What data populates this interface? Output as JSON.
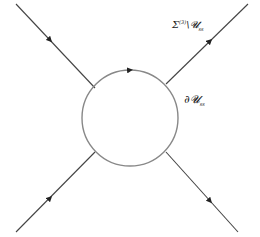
{
  "diagram": {
    "type": "feynman-like loop diagram",
    "labels": {
      "outer_sigma": "Σ",
      "outer_sup": "(3)",
      "outer_rest": "\\𝓤",
      "outer_sub": "ss",
      "boundary_main": "∂𝓤",
      "boundary_sub": "ss"
    },
    "colors": {
      "line": "#444444",
      "circle": "#888888",
      "text": "#222222"
    },
    "lines": [
      {
        "id": "top-left",
        "from": [
          16,
          4
        ],
        "to": [
          95,
          88
        ],
        "arrow": "down-right"
      },
      {
        "id": "bottom-left",
        "from": [
          16,
          232
        ],
        "to": [
          95,
          152
        ],
        "arrow": "up-right"
      },
      {
        "id": "top-right",
        "from": [
          166,
          84
        ],
        "to": [
          248,
          4
        ],
        "arrow": "up-right"
      },
      {
        "id": "bottom-right",
        "from": [
          166,
          152
        ],
        "to": [
          238,
          232
        ],
        "arrow": "down-right"
      }
    ],
    "circle": {
      "cx": 130,
      "cy": 118,
      "r": 48,
      "arrow": "clockwise-top"
    }
  }
}
